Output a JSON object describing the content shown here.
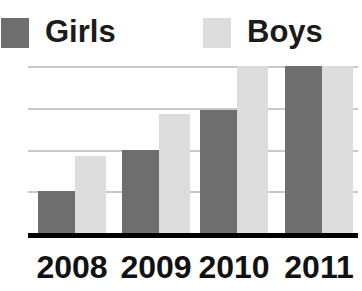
{
  "chart_data": {
    "type": "bar",
    "title": "",
    "subtitle": "",
    "xlabel": "",
    "ylabel": "",
    "categories": [
      "2008",
      "2009",
      "2010",
      "2011"
    ],
    "series": [
      {
        "name": "Girls",
        "color": "#6e6e6e",
        "values": [
          1.0,
          2.0,
          2.95,
          4.0
        ]
      },
      {
        "name": "Boys",
        "color": "#dcdcdc",
        "values": [
          1.85,
          2.85,
          4.0,
          4.0
        ]
      }
    ],
    "ylim": [
      0,
      4
    ],
    "yticks": [
      1,
      2,
      3,
      4
    ],
    "ytick_labels": [
      "",
      "",
      "",
      ""
    ],
    "grid": true,
    "grid_color": "#c9c9c9",
    "axis_color": "#000000",
    "legend_position": "top",
    "legend": [
      {
        "label": "Girls",
        "color": "#6e6e6e"
      },
      {
        "label": "Boys",
        "color": "#dcdcdc"
      }
    ]
  },
  "legend": {
    "girls": {
      "label": "Girls",
      "swatch_color": "#6e6e6e"
    },
    "boys": {
      "label": "Boys",
      "swatch_color": "#dcdcdc"
    }
  },
  "axis": {
    "ticks": [
      "2008",
      "2009",
      "2010",
      "2011"
    ]
  }
}
